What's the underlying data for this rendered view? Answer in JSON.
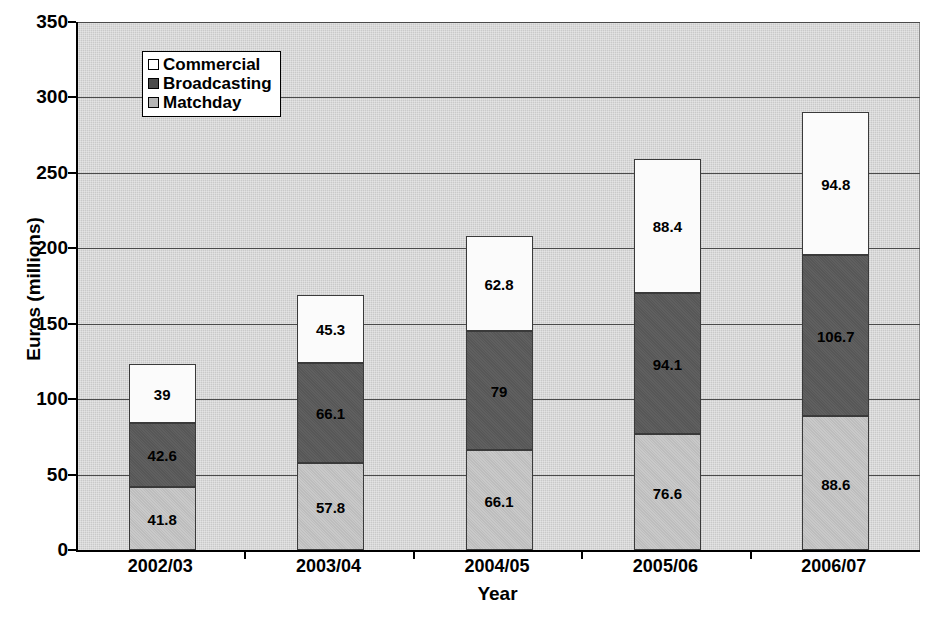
{
  "chart_data": {
    "type": "bar",
    "stacked": true,
    "title": "",
    "xlabel": "Year",
    "ylabel": "Euros (millions)",
    "categories": [
      "2002/03",
      "2003/04",
      "2004/05",
      "2005/06",
      "2006/07"
    ],
    "series": [
      {
        "name": "Matchday",
        "color": "#bdbdbd",
        "values": [
          41.8,
          57.8,
          66.1,
          76.6,
          88.6
        ]
      },
      {
        "name": "Broadcasting",
        "color": "#575757",
        "values": [
          42.6,
          66.1,
          79,
          94.1,
          106.7
        ]
      },
      {
        "name": "Commercial",
        "color": "#fbfbfb",
        "values": [
          39,
          45.3,
          62.8,
          88.4,
          94.8
        ]
      }
    ],
    "value_labels": {
      "2002/03": {
        "Matchday": "41.8",
        "Broadcasting": "42.6",
        "Commercial": "39"
      },
      "2003/04": {
        "Matchday": "57.8",
        "Broadcasting": "66.1",
        "Commercial": "45.3"
      },
      "2004/05": {
        "Matchday": "66.1",
        "Broadcasting": "79",
        "Commercial": "62.8"
      },
      "2005/06": {
        "Matchday": "76.6",
        "Broadcasting": "94.1",
        "Commercial": "88.4"
      },
      "2006/07": {
        "Matchday": "88.6",
        "Broadcasting": "106.7",
        "Commercial": "94.8"
      }
    },
    "ylim": [
      0,
      350
    ],
    "yticks": [
      "0",
      "50",
      "100",
      "150",
      "200",
      "250",
      "300",
      "350"
    ],
    "grid": true,
    "legend_position": "top-left-inside",
    "legend": [
      "Commercial",
      "Broadcasting",
      "Matchday"
    ],
    "plot_background": "#c9c9c9"
  },
  "axis": {
    "y_title": "Euros (millions)",
    "x_title": "Year",
    "y_ticks": [
      {
        "label": "350",
        "value": 350
      },
      {
        "label": "300",
        "value": 300
      },
      {
        "label": "250",
        "value": 250
      },
      {
        "label": "200",
        "value": 200
      },
      {
        "label": "150",
        "value": 150
      },
      {
        "label": "100",
        "value": 100
      },
      {
        "label": "50",
        "value": 50
      },
      {
        "label": "0",
        "value": 0
      }
    ],
    "x_ticks": [
      "2002/03",
      "2003/04",
      "2004/05",
      "2005/06",
      "2006/07"
    ]
  },
  "legend": {
    "items": [
      {
        "label": "Commercial",
        "swatch": "commercial"
      },
      {
        "label": "Broadcasting",
        "swatch": "broadcasting"
      },
      {
        "label": "Matchday",
        "swatch": "matchday"
      }
    ]
  },
  "bars": [
    {
      "category": "2002/03",
      "matchday": "41.8",
      "broadcasting": "42.6",
      "commercial": "39"
    },
    {
      "category": "2003/04",
      "matchday": "57.8",
      "broadcasting": "66.1",
      "commercial": "45.3"
    },
    {
      "category": "2004/05",
      "matchday": "66.1",
      "broadcasting": "79",
      "commercial": "62.8"
    },
    {
      "category": "2005/06",
      "matchday": "76.6",
      "broadcasting": "94.1",
      "commercial": "88.4"
    },
    {
      "category": "2006/07",
      "matchday": "88.6",
      "broadcasting": "106.7",
      "commercial": "94.8"
    }
  ]
}
